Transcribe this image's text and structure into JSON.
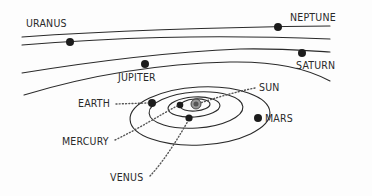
{
  "diagram": {
    "type": "solar-system-orbits",
    "labels": {
      "uranus": "URANUS",
      "neptune": "NEPTUNE",
      "jupiter": "JUPITER",
      "saturn": "SATURN",
      "sun": "SUN",
      "earth": "EARTH",
      "mercury": "MERCURY",
      "mars": "MARS",
      "venus": "VENUS"
    },
    "colors": {
      "ink": "#2a2a2a",
      "background": "#fdfdfd"
    }
  }
}
